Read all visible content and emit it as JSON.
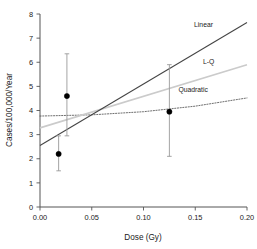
{
  "chart_data": {
    "type": "scatter",
    "title": "",
    "xlabel": "Dose (Gy)",
    "ylabel": "Cases/100,000/Year",
    "xlim": [
      0.0,
      0.2
    ],
    "ylim": [
      0,
      8
    ],
    "grid": false,
    "legend_position": "inline-at-curve-ends",
    "xticks": [
      "0.00",
      "0.05",
      "0.10",
      "0.15",
      "0.20"
    ],
    "xtick_values": [
      0.0,
      0.05,
      0.1,
      0.15,
      0.2
    ],
    "yticks": [
      "0",
      "1",
      "2",
      "3",
      "4",
      "5",
      "6",
      "7",
      "8"
    ],
    "ytick_values": [
      0,
      1,
      2,
      3,
      4,
      5,
      6,
      7,
      8
    ],
    "points": [
      {
        "x": 0.018,
        "y": 2.2,
        "ylow": 1.5,
        "yhigh": 2.95,
        "label": "point-low-dose-a"
      },
      {
        "x": 0.026,
        "y": 4.6,
        "ylow": 2.95,
        "yhigh": 6.35,
        "label": "point-low-dose-b"
      },
      {
        "x": 0.125,
        "y": 3.95,
        "ylow": 2.1,
        "yhigh": 5.9,
        "label": "point-high-dose"
      }
    ],
    "series": [
      {
        "name": "Linear",
        "style": "solid-dark",
        "color": "#444444",
        "x": [
          0.0,
          0.2
        ],
        "values": [
          2.55,
          7.65
        ]
      },
      {
        "name": "L-Q",
        "style": "solid-light",
        "color": "#cbcbcb",
        "x": [
          0.0,
          0.2
        ],
        "values": [
          3.28,
          5.9
        ]
      },
      {
        "name": "Quadratic",
        "style": "dotted",
        "color": "#555555",
        "x": [
          0.0,
          0.05,
          0.1,
          0.15,
          0.2
        ],
        "values": [
          3.77,
          3.82,
          3.95,
          4.18,
          4.52
        ]
      }
    ],
    "annotations": [
      {
        "text": "Linear",
        "x": 0.158,
        "y": 7.45
      },
      {
        "text": "L-Q",
        "x": 0.163,
        "y": 5.92
      },
      {
        "text": "Quadratic",
        "x": 0.148,
        "y": 4.78
      }
    ]
  }
}
